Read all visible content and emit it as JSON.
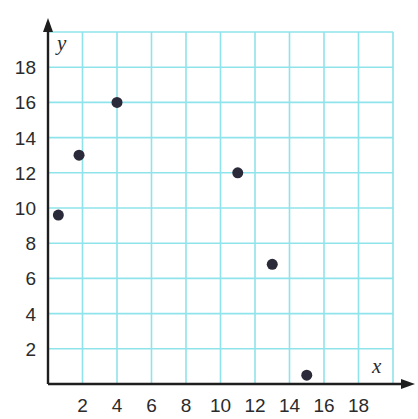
{
  "chart_data": {
    "type": "scatter",
    "title": "",
    "xlabel": "x",
    "ylabel": "y",
    "xlim": [
      0,
      20
    ],
    "ylim": [
      0,
      20
    ],
    "grid": true,
    "legend": null,
    "x_ticks": [
      2,
      4,
      6,
      8,
      10,
      12,
      14,
      16,
      18
    ],
    "y_ticks": [
      2,
      4,
      6,
      8,
      10,
      12,
      14,
      16,
      18
    ],
    "points": [
      {
        "x": 0.6,
        "y": 9.6
      },
      {
        "x": 1.8,
        "y": 13
      },
      {
        "x": 4,
        "y": 16
      },
      {
        "x": 11,
        "y": 12
      },
      {
        "x": 13,
        "y": 6.8
      },
      {
        "x": 15,
        "y": 0.5
      }
    ]
  },
  "style": {
    "grid_color": "#8fe3ea",
    "axis_color": "#1e1e1e",
    "point_color": "#2a2a3a",
    "text_color": "#2b2b2b"
  },
  "layout": {
    "origin_px": [
      48,
      384
    ],
    "unit_px_x": 17.25,
    "unit_px_y": 17.6
  }
}
